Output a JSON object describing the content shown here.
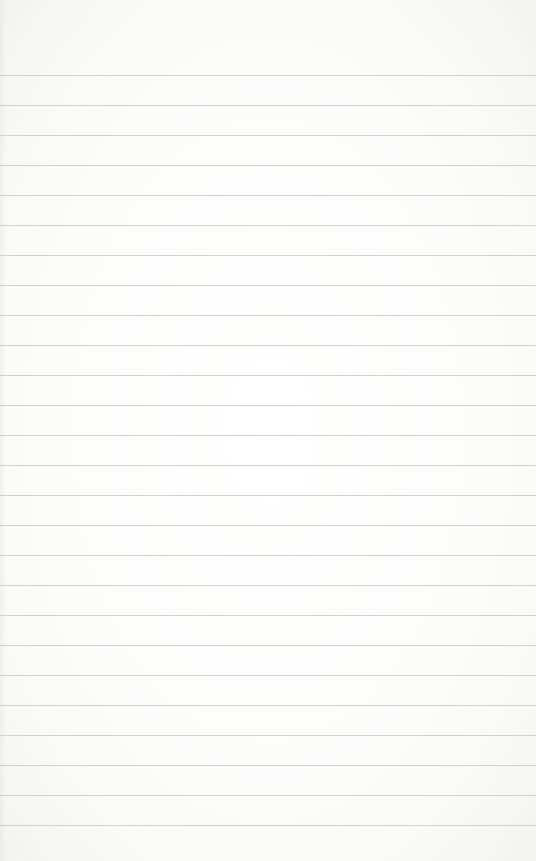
{
  "paper": {
    "background_color": "#fbfbfa",
    "line_color": "#c9c9c7",
    "first_line_y": 75,
    "line_spacing": 30,
    "line_count": 26
  }
}
